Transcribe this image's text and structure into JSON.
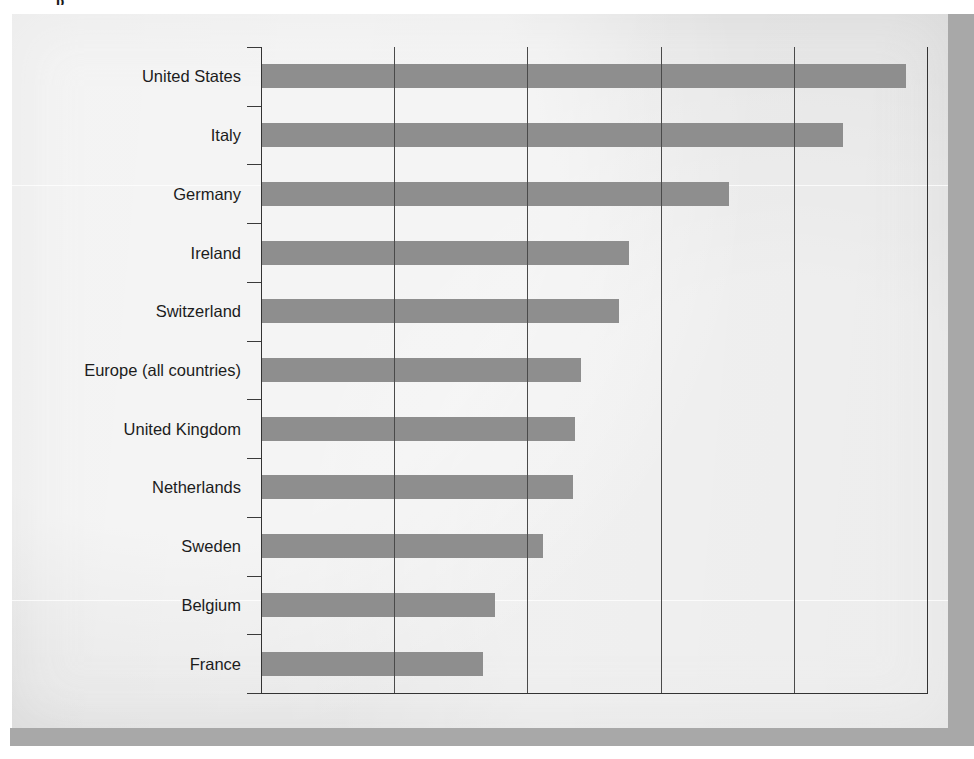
{
  "page": {
    "background_color": "#ebebeb",
    "shadow_color": "#a8a8a8",
    "clipped_top_text": "p"
  },
  "chart_data": {
    "type": "bar",
    "orientation": "horizontal",
    "title": "",
    "subtitle": "",
    "xlabel": "",
    "ylabel": "",
    "categories": [
      "United States",
      "Italy",
      "Germany",
      "Ireland",
      "Switzerland",
      "Europe (all countries)",
      "United Kingdom",
      "Netherlands",
      "Sweden",
      "Belgium",
      "France"
    ],
    "values": [
      4.84,
      4.37,
      3.51,
      2.76,
      2.69,
      2.4,
      2.36,
      2.34,
      2.12,
      1.76,
      1.67
    ],
    "xlim": [
      0,
      5
    ],
    "gridline_positions": [
      1,
      2,
      3,
      4,
      5
    ],
    "tick_labels": [],
    "grid": true,
    "legend": false,
    "bar_color": "#8e8e8e",
    "axis_color": "#333333",
    "gridline_color": "#4a4a4a"
  }
}
